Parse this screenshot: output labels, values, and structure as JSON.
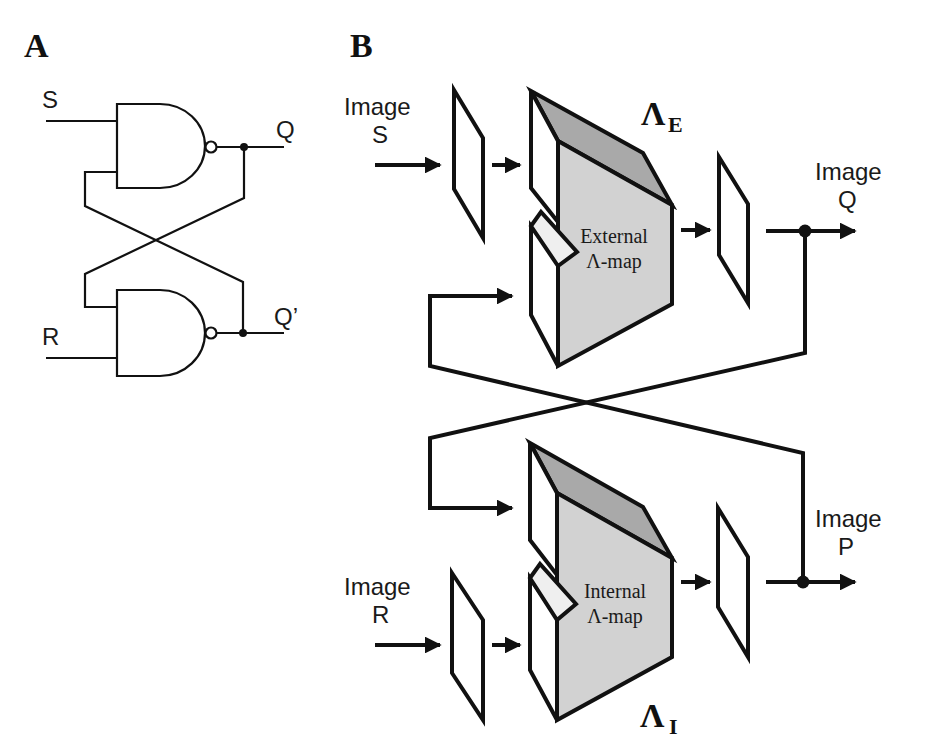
{
  "panels": {
    "a": {
      "label": "A",
      "title": "NAND SR latch",
      "inputs": {
        "s": "S",
        "r": "R"
      },
      "outputs": {
        "q": "Q",
        "q_bar": "Q’"
      }
    },
    "b": {
      "label": "B",
      "inputs": {
        "s": {
          "line1": "Image",
          "line2": "S"
        },
        "r": {
          "line1": "Image",
          "line2": "R"
        }
      },
      "outputs": {
        "q": {
          "line1": "Image",
          "line2": "Q"
        },
        "p": {
          "line1": "Image",
          "line2": "P"
        }
      },
      "maps": {
        "external": {
          "line1": "External",
          "line2": "Λ-map",
          "symbol": "Λ",
          "subscript": "E"
        },
        "internal": {
          "line1": "Internal",
          "line2": "Λ-map",
          "symbol": "Λ",
          "subscript": "I"
        }
      }
    }
  },
  "colors": {
    "ink": "#111111",
    "top_face": "#a9a9a9",
    "front_face": "#d2d2d2",
    "notch": "#efefef",
    "background": "#ffffff"
  }
}
